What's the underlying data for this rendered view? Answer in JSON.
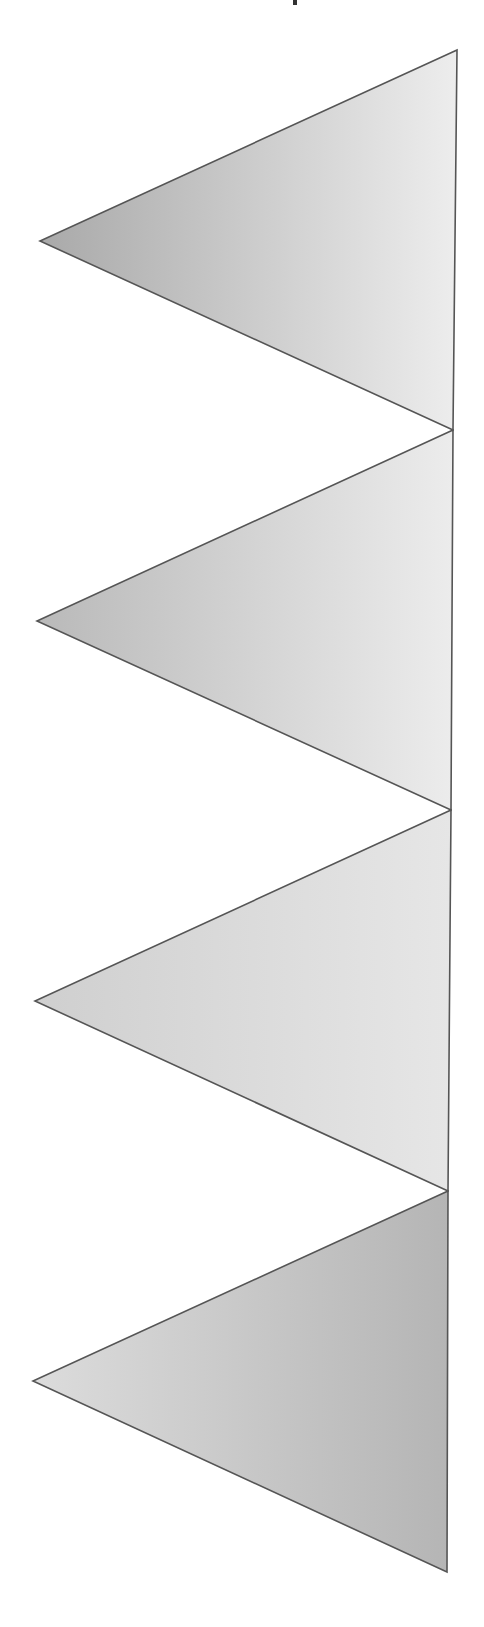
{
  "header": {
    "title_text": ""
  },
  "diagram": {
    "width": 484,
    "height": 1627,
    "stroke_color": "#555555",
    "stroke_width": 1.6,
    "triangles": [
      {
        "id": "triangle-1",
        "points": [
          [
            457,
            50
          ],
          [
            40,
            241
          ],
          [
            453,
            430
          ]
        ],
        "gradient": {
          "from": "#a9a9a9",
          "to": "#ededed",
          "direction": "left-to-right"
        }
      },
      {
        "id": "triangle-2",
        "points": [
          [
            453,
            430
          ],
          [
            37,
            621
          ],
          [
            451,
            810
          ]
        ],
        "gradient": {
          "from": "#b9b9b9",
          "to": "#ececec",
          "direction": "left-to-right"
        }
      },
      {
        "id": "triangle-3",
        "points": [
          [
            451,
            810
          ],
          [
            35,
            1001
          ],
          [
            448,
            1191
          ]
        ],
        "gradient": {
          "from": "#cfcfcf",
          "to": "#e6e6e6",
          "direction": "left-to-right"
        }
      },
      {
        "id": "triangle-4",
        "points": [
          [
            448,
            1191
          ],
          [
            33,
            1381
          ],
          [
            447,
            1572
          ]
        ],
        "gradient": {
          "from": "#dcdcdc",
          "to": "#b5b5b5",
          "direction": "left-to-right"
        }
      }
    ]
  }
}
